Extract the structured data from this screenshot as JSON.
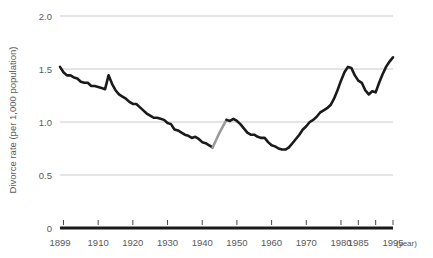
{
  "chart_data": {
    "type": "line",
    "title": "",
    "xlabel": "year",
    "ylabel": "Divorce rate (per 1,000 population)",
    "xlim": [
      1899,
      1995
    ],
    "ylim": [
      0,
      2.0
    ],
    "grid": "horizontal",
    "legend": "none",
    "y_ticks": [
      "0",
      "0.5",
      "1.0",
      "1.5",
      "2.0"
    ],
    "y_tick_values": [
      0,
      0.5,
      1.0,
      1.5,
      2.0
    ],
    "x_ticks": [
      "1899",
      "1910",
      "1920",
      "1930",
      "1940",
      "1950",
      "1960",
      "1970",
      "1980",
      "1985",
      "1995"
    ],
    "x_tick_values": [
      1899,
      1910,
      1920,
      1930,
      1940,
      1950,
      1960,
      1970,
      1980,
      1985,
      1995
    ],
    "x_unit_label": "(year)",
    "series": [
      {
        "name": "Divorce rate (observed)",
        "color": "#1a1a1a",
        "style": "solid",
        "x": [
          1899,
          1900,
          1901,
          1902,
          1903,
          1904,
          1905,
          1906,
          1907,
          1908,
          1909,
          1910,
          1911,
          1912,
          1913,
          1914,
          1915,
          1916,
          1917,
          1918,
          1919,
          1920,
          1921,
          1922,
          1923,
          1924,
          1925,
          1926,
          1927,
          1928,
          1929,
          1930,
          1931,
          1932,
          1933,
          1934,
          1935,
          1936,
          1937,
          1938,
          1939,
          1940,
          1941,
          1942,
          1943
        ],
        "y": [
          1.52,
          1.47,
          1.44,
          1.44,
          1.42,
          1.41,
          1.38,
          1.37,
          1.37,
          1.34,
          1.34,
          1.33,
          1.32,
          1.31,
          1.44,
          1.36,
          1.3,
          1.26,
          1.24,
          1.22,
          1.19,
          1.17,
          1.17,
          1.14,
          1.11,
          1.08,
          1.06,
          1.04,
          1.04,
          1.03,
          1.02,
          0.99,
          0.98,
          0.93,
          0.92,
          0.9,
          0.88,
          0.87,
          0.85,
          0.86,
          0.84,
          0.81,
          0.8,
          0.78,
          0.76
        ]
      },
      {
        "name": "Divorce rate (interpolated, wartime gap)",
        "color": "#9b9b9b",
        "style": "solid",
        "x": [
          1943,
          1944,
          1945,
          1946,
          1947
        ],
        "y": [
          0.76,
          0.83,
          0.9,
          0.96,
          1.02
        ]
      },
      {
        "name": "Divorce rate (observed, postwar)",
        "color": "#1a1a1a",
        "style": "solid",
        "x": [
          1947,
          1948,
          1949,
          1950,
          1951,
          1952,
          1953,
          1954,
          1955,
          1956,
          1957,
          1958,
          1959,
          1960,
          1961,
          1962,
          1963,
          1964,
          1965,
          1966,
          1967,
          1968,
          1969,
          1970,
          1971,
          1972,
          1973,
          1974,
          1975,
          1976,
          1977,
          1978,
          1979,
          1980,
          1981,
          1982,
          1983,
          1984,
          1985,
          1986,
          1987,
          1988,
          1989,
          1990,
          1991,
          1992,
          1993,
          1994,
          1995
        ],
        "y": [
          1.02,
          1.01,
          1.03,
          1.01,
          0.98,
          0.94,
          0.9,
          0.88,
          0.88,
          0.86,
          0.85,
          0.85,
          0.81,
          0.78,
          0.77,
          0.75,
          0.74,
          0.74,
          0.76,
          0.8,
          0.84,
          0.88,
          0.93,
          0.96,
          1.0,
          1.02,
          1.05,
          1.09,
          1.11,
          1.13,
          1.16,
          1.22,
          1.3,
          1.39,
          1.47,
          1.52,
          1.51,
          1.44,
          1.39,
          1.37,
          1.3,
          1.26,
          1.29,
          1.28,
          1.37,
          1.45,
          1.52,
          1.57,
          1.61
        ]
      }
    ]
  },
  "axis": {
    "y_axis_title": "Divorce rate (per 1,000 population)",
    "x_axis_unit": "(year)"
  }
}
